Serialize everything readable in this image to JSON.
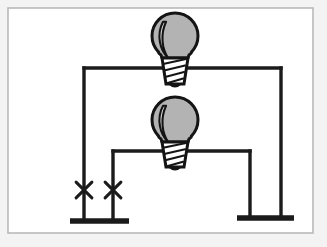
{
  "figure": {
    "kind": "electrical-circuit-schematic",
    "title": "",
    "caption": "",
    "canvas": {
      "width": 327,
      "height": 247
    },
    "background_color": "#ffffff"
  },
  "frame": {
    "name": "diagram-border",
    "x": 8,
    "y": 8,
    "width": 305,
    "height": 225,
    "stroke_color": "#b9b9b9",
    "stroke_width": 1.6,
    "fill_color": "#ffffff",
    "outer_tint_color": "#f3f3f3"
  },
  "style": {
    "wire_color": "#1b1b1b",
    "wire_width": 3.4,
    "ground_bar_color": "#1b1b1b",
    "ground_bar_height": 5.5,
    "bulb_glass_fill": "#b3b3b3",
    "bulb_glass_highlight": "#dcdcdc",
    "bulb_outline_color": "#141414",
    "bulb_outline_width": 3.0,
    "bulb_base_fill": "#ffffff",
    "switch_mark_color": "#1b1b1b",
    "switch_mark_width": 3.0
  },
  "components": {
    "bulbs": [
      {
        "id": "bulb-top",
        "label": "",
        "center_x": 175,
        "glass_center_y": 36,
        "glass_radius": 23,
        "neck_top_y": 54,
        "base_top_y": 58,
        "base_bottom_y": 84,
        "base_top_width": 26,
        "base_bottom_width": 18,
        "base_thread_count": 4,
        "state": "unlit"
      },
      {
        "id": "bulb-middle",
        "label": "",
        "center_x": 175,
        "glass_center_y": 120,
        "glass_radius": 23,
        "neck_top_y": 138,
        "base_top_y": 142,
        "base_bottom_y": 167,
        "base_top_width": 26,
        "base_bottom_width": 18,
        "base_thread_count": 4,
        "state": "unlit"
      }
    ],
    "wires": [
      {
        "id": "wire-top-horizontal",
        "x1": 84,
        "y1": 68,
        "x2": 281,
        "y2": 68
      },
      {
        "id": "wire-top-left-vertical",
        "x1": 84,
        "y1": 68,
        "x2": 84,
        "y2": 221
      },
      {
        "id": "wire-top-right-vertical",
        "x1": 281,
        "y1": 68,
        "x2": 281,
        "y2": 218
      },
      {
        "id": "wire-middle-horizontal",
        "x1": 113,
        "y1": 151,
        "x2": 250,
        "y2": 151
      },
      {
        "id": "wire-middle-left-vertical",
        "x1": 113,
        "y1": 151,
        "x2": 113,
        "y2": 221
      },
      {
        "id": "wire-middle-right-vertical",
        "x1": 250,
        "y1": 151,
        "x2": 250,
        "y2": 218
      }
    ],
    "switch_marks": [
      {
        "id": "switch-mark-left",
        "center_x": 84,
        "center_y": 190,
        "arm_length": 11
      },
      {
        "id": "switch-mark-right",
        "center_x": 113,
        "center_y": 190,
        "arm_length": 11
      }
    ],
    "grounds": [
      {
        "id": "ground-left",
        "x1": 70,
        "x2": 129,
        "y": 221
      },
      {
        "id": "ground-right",
        "x1": 237,
        "x2": 294,
        "y": 218
      }
    ]
  }
}
